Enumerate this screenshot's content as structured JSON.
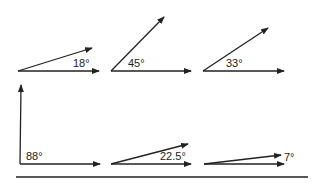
{
  "diagram": {
    "title": "",
    "angles": [
      {
        "label": "18°",
        "degrees": 18
      },
      {
        "label": "45°",
        "degrees": 45
      },
      {
        "label": "33°",
        "degrees": 33
      },
      {
        "label": "88°",
        "degrees": 88
      },
      {
        "label": "22.5°",
        "degrees": 22.5
      },
      {
        "label": "7°",
        "degrees": 7
      }
    ],
    "colors": {
      "stroke": "#222222",
      "background": "#ffffff"
    }
  }
}
